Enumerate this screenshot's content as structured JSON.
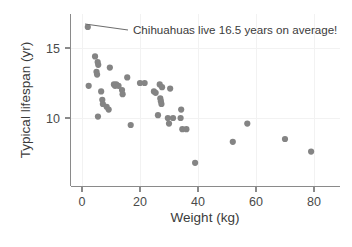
{
  "chart_data": {
    "type": "scatter",
    "title": "",
    "xlabel": "Weight (kg)",
    "ylabel": "Typical lifespan (yr)",
    "xlim": [
      -3,
      84
    ],
    "ylim": [
      6.2,
      17.2
    ],
    "xticks": [
      0,
      20,
      40,
      60,
      80
    ],
    "xtick_labels": [
      "0",
      "20",
      "40",
      "60",
      "80"
    ],
    "yticks": [
      10,
      15
    ],
    "ytick_labels": [
      "10",
      "15"
    ],
    "grid": "faint-vertical-and-horizontal",
    "legend": "none",
    "marker_color": "#848484",
    "axis_color": "#8a8a8a",
    "text_color": "#3b3b3b",
    "background": "#ffffff",
    "points": [
      [
        2.0,
        16.5
      ],
      [
        2.3,
        12.3
      ],
      [
        4.5,
        14.4
      ],
      [
        5.0,
        13.3
      ],
      [
        5.2,
        13.1
      ],
      [
        5.4,
        14.0
      ],
      [
        5.6,
        13.8
      ],
      [
        5.5,
        10.1
      ],
      [
        6.6,
        11.9
      ],
      [
        7.0,
        11.3
      ],
      [
        7.2,
        11.0
      ],
      [
        8.5,
        10.8
      ],
      [
        9.2,
        10.6
      ],
      [
        9.6,
        13.6
      ],
      [
        11.0,
        12.4
      ],
      [
        11.4,
        12.3
      ],
      [
        11.8,
        12.4
      ],
      [
        12.6,
        12.3
      ],
      [
        13.8,
        12.0
      ],
      [
        14.0,
        11.7
      ],
      [
        15.6,
        12.9
      ],
      [
        16.8,
        9.5
      ],
      [
        20.0,
        12.5
      ],
      [
        21.6,
        12.5
      ],
      [
        24.8,
        11.9
      ],
      [
        25.4,
        11.8
      ],
      [
        26.8,
        12.4
      ],
      [
        27.0,
        11.4
      ],
      [
        27.2,
        11.2
      ],
      [
        27.4,
        11.0
      ],
      [
        27.6,
        12.2
      ],
      [
        26.2,
        10.2
      ],
      [
        30.4,
        12.1
      ],
      [
        29.6,
        10.0
      ],
      [
        30.0,
        9.6
      ],
      [
        31.4,
        10.0
      ],
      [
        34.2,
        10.6
      ],
      [
        34.0,
        10.0
      ],
      [
        34.6,
        9.2
      ],
      [
        36.0,
        9.2
      ],
      [
        39.0,
        6.8
      ],
      [
        52.0,
        8.3
      ],
      [
        57.0,
        9.6
      ],
      [
        70.0,
        8.5
      ],
      [
        79.0,
        7.6
      ]
    ],
    "annotations": [
      {
        "text": "Chihuahuas live 16.5 years on average!",
        "target_point": [
          2.0,
          16.5
        ],
        "leader_from": [
          85,
          24
        ],
        "leader_to": [
          128,
          30
        ],
        "text_x": 133,
        "text_y": 34
      }
    ]
  }
}
